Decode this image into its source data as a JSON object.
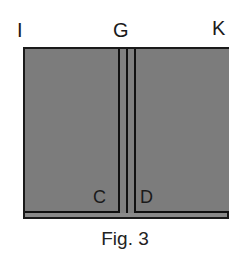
{
  "figure": {
    "caption": "Fig. 3",
    "top_labels": {
      "left": "I",
      "center": "G",
      "right": "K"
    },
    "inner_labels": {
      "left_panel": "C",
      "right_panel": "D"
    },
    "colors": {
      "fill": "#7a7a7a",
      "outline": "#111111",
      "background": "#ffffff"
    }
  }
}
